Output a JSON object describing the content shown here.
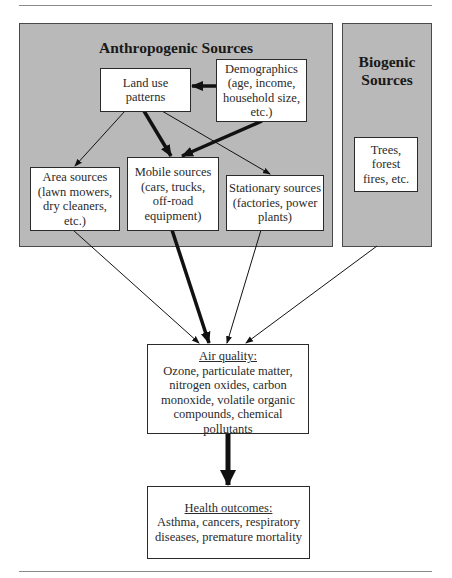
{
  "diagram": {
    "groups": {
      "anthropogenic": {
        "title": "Anthropogenic Sources"
      },
      "biogenic": {
        "title_line1": "Biogenic",
        "title_line2": "Sources"
      }
    },
    "nodes": {
      "land_use": {
        "lines": [
          "Land use",
          "patterns"
        ]
      },
      "demographics": {
        "lines": [
          "Demographics",
          "(age, income,",
          "household size,",
          "etc.)"
        ]
      },
      "area_sources": {
        "lines": [
          "Area sources",
          "(lawn mowers,",
          "dry cleaners,",
          "etc.)"
        ]
      },
      "mobile_sources": {
        "lines": [
          "Mobile sources",
          "(cars, trucks,",
          "off-road",
          "equipment)"
        ]
      },
      "stationary_sources": {
        "lines": [
          "Stationary sources",
          "(factories, power",
          "plants)"
        ]
      },
      "trees": {
        "lines": [
          "Trees,",
          "forest",
          "fires, etc."
        ]
      },
      "air_quality": {
        "heading": "Air quality:",
        "lines": [
          "Ozone, particulate matter,",
          "nitrogen oxides, carbon",
          "monoxide, volatile organic",
          "compounds, chemical pollutants"
        ]
      },
      "health_outcomes": {
        "heading": "Health outcomes:",
        "lines": [
          "Asthma, cancers, respiratory",
          "diseases, premature mortality"
        ]
      }
    },
    "edges": [
      {
        "from": "demographics",
        "to": "land_use",
        "weight": "thick"
      },
      {
        "from": "land_use",
        "to": "area_sources",
        "weight": "thin"
      },
      {
        "from": "land_use",
        "to": "mobile_sources",
        "weight": "thick"
      },
      {
        "from": "land_use",
        "to": "stationary_sources",
        "weight": "thin"
      },
      {
        "from": "demographics",
        "to": "mobile_sources",
        "weight": "thick"
      },
      {
        "from": "area_sources",
        "to": "air_quality",
        "weight": "thin"
      },
      {
        "from": "mobile_sources",
        "to": "air_quality",
        "weight": "thick"
      },
      {
        "from": "stationary_sources",
        "to": "air_quality",
        "weight": "thin"
      },
      {
        "from": "biogenic",
        "to": "air_quality",
        "weight": "thin"
      },
      {
        "from": "air_quality",
        "to": "health_outcomes",
        "weight": "thick"
      }
    ],
    "colors": {
      "group_fill": "#b9b9b9",
      "node_fill": "#ffffff",
      "stroke": "#111111"
    }
  }
}
